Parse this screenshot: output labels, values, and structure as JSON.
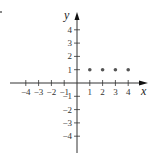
{
  "chart_data": {
    "type": "scatter",
    "title": "",
    "xlabel": "x",
    "ylabel": "y",
    "xlim": [
      -4,
      4
    ],
    "ylim": [
      -4,
      4
    ],
    "grid": false,
    "x_ticks": [
      -4,
      -3,
      -2,
      -1,
      1,
      2,
      3,
      4
    ],
    "x_tick_labels": [
      "−4",
      "−3",
      "−2",
      "−1",
      "1",
      "2",
      "3",
      "4"
    ],
    "y_ticks": [
      -4,
      -3,
      -2,
      -1,
      1,
      2,
      3,
      4
    ],
    "y_tick_labels": [
      "−4",
      "−3",
      "−2",
      "−1",
      "1",
      "2",
      "3",
      "4"
    ],
    "series": [
      {
        "name": "points",
        "points": [
          {
            "x": 1,
            "y": 1
          },
          {
            "x": 2,
            "y": 1
          },
          {
            "x": 3,
            "y": 1
          },
          {
            "x": 4,
            "y": 1
          }
        ]
      }
    ],
    "colors": {
      "axis": "#333333",
      "point": "#555555"
    }
  }
}
